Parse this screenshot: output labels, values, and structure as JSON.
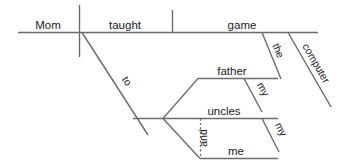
{
  "diagram": {
    "type": "reed-kellogg-sentence-diagram",
    "sentence": "Mom taught the computer game to my father and my uncles and me.",
    "colors": {
      "line": "#6b6b6b",
      "text": "#1a1a1a",
      "background": "#ffffff"
    },
    "words": {
      "subject": "Mom",
      "verb": "taught",
      "direct_object": "game",
      "object_modifier_1": "the",
      "object_modifier_2": "computer",
      "preposition": "to",
      "prep_object_1": "father",
      "prep_object_1_modifier": "my",
      "prep_object_2": "uncles",
      "prep_object_2_modifier": "my",
      "conjunction": "and",
      "prep_object_3": "me"
    }
  }
}
